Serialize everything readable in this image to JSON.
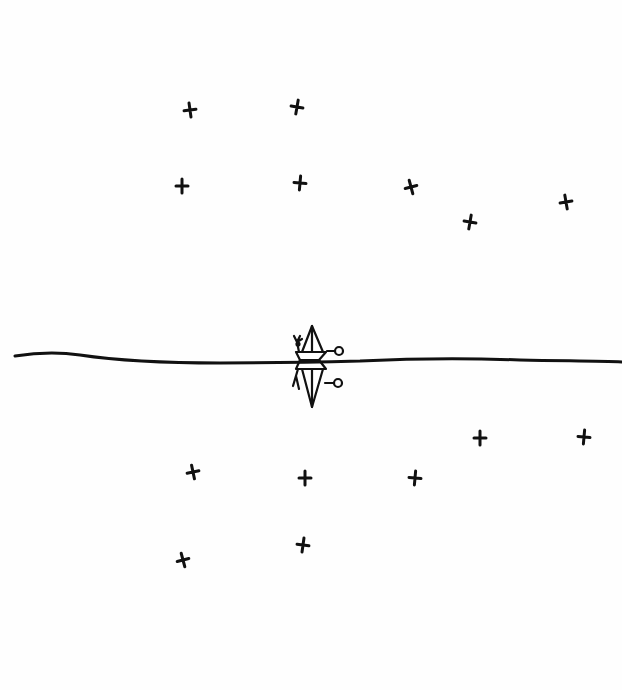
{
  "scene": {
    "title": "",
    "description": "Hand-drawn ink sketch: a sailboat on a horizon line with its mirrored reflection, surrounded by cross-shaped stars above and their reflections below",
    "ink_color": "#111111",
    "background_color": "#fefefe"
  },
  "horizon": {
    "y": 360,
    "x_start": 15,
    "x_end": 622
  },
  "boat": {
    "x": 312,
    "y": 360
  },
  "stars_above": [
    {
      "x": 190,
      "y": 110,
      "rot": -8
    },
    {
      "x": 297,
      "y": 107,
      "rot": 10
    },
    {
      "x": 182,
      "y": 186,
      "rot": 0
    },
    {
      "x": 300,
      "y": 183,
      "rot": 5
    },
    {
      "x": 411,
      "y": 187,
      "rot": -15
    },
    {
      "x": 470,
      "y": 222,
      "rot": 10
    },
    {
      "x": 566,
      "y": 202,
      "rot": -10
    }
  ],
  "stars_below": [
    {
      "x": 480,
      "y": 438,
      "rot": 0
    },
    {
      "x": 584,
      "y": 437,
      "rot": 5
    },
    {
      "x": 193,
      "y": 472,
      "rot": -12
    },
    {
      "x": 305,
      "y": 478,
      "rot": 0
    },
    {
      "x": 415,
      "y": 478,
      "rot": 5
    },
    {
      "x": 183,
      "y": 560,
      "rot": -15
    },
    {
      "x": 303,
      "y": 545,
      "rot": 8
    }
  ]
}
